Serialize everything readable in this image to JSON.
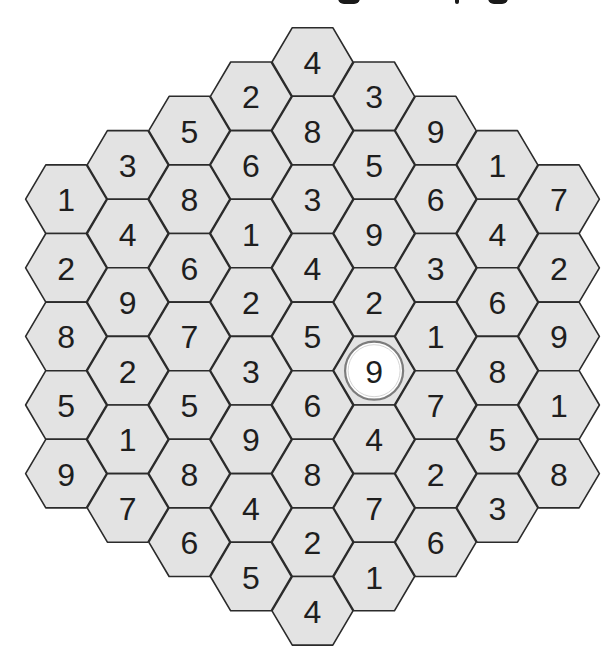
{
  "puzzle": {
    "type": "hexagonal-number-grid",
    "board_radius": 4,
    "geometry": {
      "center_x": 312.5,
      "top_center_y": 62,
      "column_spacing": 61.6,
      "row_step": 68.6,
      "hex_radius": 40.5
    },
    "colors": {
      "cell_fill": "#e3e3e3",
      "cell_stroke": "#2b2b2b",
      "digit": "#1e1e1e",
      "highlight_fill": "#ffffff",
      "highlight_ring": "#7c7c7c"
    },
    "columns": [
      {
        "index": 0,
        "values": [
          1,
          2,
          8,
          5,
          9
        ]
      },
      {
        "index": 1,
        "values": [
          3,
          4,
          9,
          2,
          1,
          7
        ]
      },
      {
        "index": 2,
        "values": [
          5,
          8,
          6,
          7,
          5,
          8,
          6
        ]
      },
      {
        "index": 3,
        "values": [
          2,
          6,
          1,
          2,
          3,
          9,
          4,
          5
        ]
      },
      {
        "index": 4,
        "values": [
          4,
          8,
          3,
          4,
          5,
          6,
          8,
          2,
          4
        ]
      },
      {
        "index": 5,
        "values": [
          3,
          5,
          9,
          2,
          9,
          4,
          7,
          1
        ]
      },
      {
        "index": 6,
        "values": [
          9,
          6,
          3,
          1,
          7,
          2,
          6
        ]
      },
      {
        "index": 7,
        "values": [
          1,
          4,
          6,
          8,
          5,
          3
        ]
      },
      {
        "index": 8,
        "values": [
          7,
          2,
          9,
          1,
          8
        ]
      }
    ],
    "highlighted_cell": {
      "column": 5,
      "row": 4,
      "value": 9,
      "style": "white-circle"
    }
  }
}
